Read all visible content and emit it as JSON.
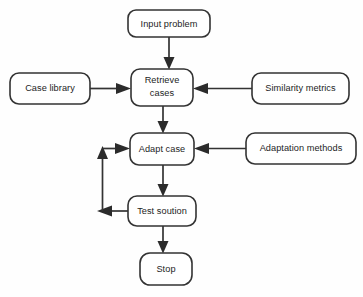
{
  "diagram": {
    "type": "flowchart",
    "background_color": "#fefefe",
    "node_fill": "#ffffff",
    "node_border_color": "#333333",
    "arrow_color": "#2b2b2b",
    "nodes": [
      {
        "id": "input-problem",
        "label": "Input problem",
        "shape": "rounded-rectangle",
        "x": 128,
        "y": 10,
        "w": 82,
        "h": 27
      },
      {
        "id": "case-library",
        "label": "Case library",
        "shape": "rounded-rectangle",
        "x": 10,
        "y": 73,
        "w": 80,
        "h": 31
      },
      {
        "id": "retrieve-cases",
        "label": "Retrieve cases",
        "line1": "Retrieve",
        "line2": "cases",
        "shape": "rounded-rectangle",
        "x": 131,
        "y": 69,
        "w": 62,
        "h": 37
      },
      {
        "id": "similarity-metrics",
        "label": "Similarity metrics",
        "shape": "rounded-rectangle",
        "x": 252,
        "y": 73,
        "w": 97,
        "h": 31
      },
      {
        "id": "adapt-case",
        "label": "Adapt case",
        "shape": "rounded-rectangle",
        "x": 130,
        "y": 133,
        "w": 64,
        "h": 32
      },
      {
        "id": "adaptation-methods",
        "label": "Adaptation methods",
        "shape": "rounded-rectangle",
        "x": 246,
        "y": 133,
        "w": 110,
        "h": 31
      },
      {
        "id": "test-solution",
        "label": "Test soution",
        "shape": "rounded-rectangle",
        "x": 128,
        "y": 196,
        "w": 68,
        "h": 30
      },
      {
        "id": "stop",
        "label": "Stop",
        "shape": "rounded-rectangle",
        "x": 140,
        "y": 253,
        "w": 52,
        "h": 32
      }
    ],
    "edges": [
      {
        "id": "edge-input-to-retrieve",
        "from": "input-problem",
        "to": "retrieve-cases",
        "direction": "down"
      },
      {
        "id": "edge-library-to-retrieve",
        "from": "case-library",
        "to": "retrieve-cases",
        "direction": "right"
      },
      {
        "id": "edge-similarity-to-retrieve",
        "from": "similarity-metrics",
        "to": "retrieve-cases",
        "direction": "left"
      },
      {
        "id": "edge-retrieve-to-adapt",
        "from": "retrieve-cases",
        "to": "adapt-case",
        "direction": "down"
      },
      {
        "id": "edge-methods-to-adapt",
        "from": "adaptation-methods",
        "to": "adapt-case",
        "direction": "left"
      },
      {
        "id": "edge-adapt-to-test",
        "from": "adapt-case",
        "to": "test-solution",
        "direction": "down"
      },
      {
        "id": "edge-test-to-adapt-feedback",
        "from": "test-solution",
        "to": "adapt-case",
        "direction": "loop-left"
      },
      {
        "id": "edge-test-to-stop",
        "from": "test-solution",
        "to": "stop",
        "direction": "down"
      }
    ]
  }
}
